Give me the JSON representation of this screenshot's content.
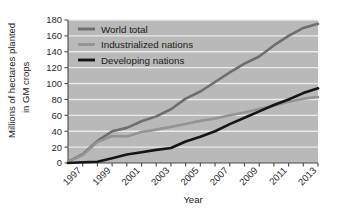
{
  "chart_data": {
    "type": "line",
    "title": "",
    "xlabel": "Year",
    "ylabel": "Millions of hectares planted in GM crops",
    "ylabel_line1": "Millions of hectares planted",
    "ylabel_line2": "in GM crops",
    "xlim": [
      1996,
      2013
    ],
    "ylim": [
      0,
      180
    ],
    "ytick_step": 20,
    "xtick_step": 1,
    "xtick_label_step": 2,
    "grid": "horizontal-white",
    "legend_position": "top-left-inside",
    "plot_background": "#b9b9b9",
    "yticks": [
      0,
      20,
      40,
      60,
      80,
      100,
      120,
      140,
      160,
      180
    ],
    "ytick_labels": [
      "0",
      "20",
      "40",
      "60",
      "80",
      "100",
      "120",
      "140",
      "160",
      "180"
    ],
    "x": [
      1996,
      1997,
      1998,
      1999,
      2000,
      2001,
      2002,
      2003,
      2004,
      2005,
      2006,
      2007,
      2008,
      2009,
      2010,
      2011,
      2012,
      2013
    ],
    "xtick_labels": [
      "1997",
      "1999",
      "2001",
      "2003",
      "2005",
      "2007",
      "2009",
      "2011",
      "2013"
    ],
    "xtick_label_years": [
      1997,
      1999,
      2001,
      2003,
      2005,
      2007,
      2009,
      2011,
      2013
    ],
    "series": [
      {
        "name": "World total",
        "color": "#6e6e6e",
        "values": [
          1.7,
          11,
          27.8,
          39.9,
          44.2,
          52.6,
          58.7,
          67.7,
          81,
          90,
          102,
          114,
          125,
          134,
          148,
          160,
          170,
          175.2
        ]
      },
      {
        "name": "Industrialized nations",
        "color": "#949494",
        "values": [
          1.7,
          10,
          26.5,
          34,
          33.5,
          39,
          42,
          45.5,
          49,
          53,
          56,
          60,
          63.5,
          68,
          72,
          77,
          81,
          83
        ]
      },
      {
        "name": "Developing nations",
        "color": "#151515",
        "values": [
          0,
          1,
          1.5,
          6,
          10.7,
          13.5,
          16.5,
          18.8,
          27,
          33,
          40,
          49,
          57,
          65,
          73,
          80,
          88,
          94
        ]
      }
    ],
    "legend": [
      {
        "label": "World total",
        "color": "#6e6e6e"
      },
      {
        "label": "Industrialized nations",
        "color": "#949494"
      },
      {
        "label": "Developing nations",
        "color": "#151515"
      }
    ]
  }
}
